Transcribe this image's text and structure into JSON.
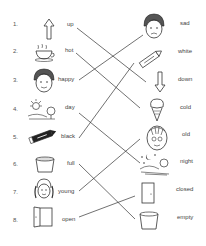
{
  "worksheet": {
    "rows": [
      {
        "number": "1.",
        "left_word": "up",
        "left_icon": "up-arrow-icon",
        "right_word": "sad",
        "right_icon": "sad-face-icon"
      },
      {
        "number": "2.",
        "left_word": "hot",
        "left_icon": "hot-cup-icon",
        "right_word": "white",
        "right_icon": "white-crayon-icon"
      },
      {
        "number": "3.",
        "left_word": "happy",
        "left_icon": "happy-face-icon",
        "right_word": "down",
        "right_icon": "down-arrow-icon"
      },
      {
        "number": "4.",
        "left_word": "day",
        "left_icon": "sun-day-icon",
        "right_word": "cold",
        "right_icon": "ice-cream-icon"
      },
      {
        "number": "5.",
        "left_word": "black",
        "left_icon": "black-crayon-icon",
        "right_word": "old",
        "right_icon": "old-face-icon"
      },
      {
        "number": "6.",
        "left_word": "full",
        "left_icon": "full-bucket-icon",
        "right_word": "night",
        "right_icon": "moon-night-icon"
      },
      {
        "number": "7.",
        "left_word": "young",
        "left_icon": "girl-face-icon",
        "right_word": "closed",
        "right_icon": "closed-door-icon"
      },
      {
        "number": "8.",
        "left_word": "open",
        "left_icon": "open-door-icon",
        "right_word": "empty",
        "right_icon": "empty-bucket-icon"
      }
    ],
    "matches": [
      {
        "from": "up",
        "to": "down"
      },
      {
        "from": "hot",
        "to": "cold"
      },
      {
        "from": "happy",
        "to": "sad"
      },
      {
        "from": "day",
        "to": "night"
      },
      {
        "from": "black",
        "to": "white"
      },
      {
        "from": "full",
        "to": "empty"
      },
      {
        "from": "young",
        "to": "old"
      },
      {
        "from": "open",
        "to": "closed"
      }
    ],
    "line_color": "#333333"
  }
}
